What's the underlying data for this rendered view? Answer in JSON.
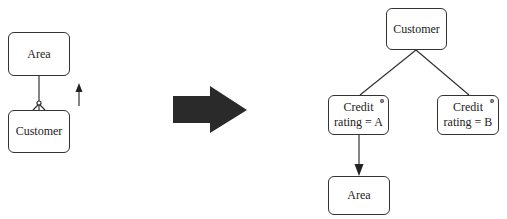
{
  "left": {
    "area_box": {
      "label": "Area"
    },
    "customer_box": {
      "label": "Customer"
    }
  },
  "right": {
    "customer_box": {
      "label": "Customer"
    },
    "credit_a_box": {
      "label": "Credit\nrating = A",
      "marker": "o"
    },
    "credit_b_box": {
      "label": "Credit\nrating = B",
      "marker": "o"
    },
    "area_box": {
      "label": "Area"
    }
  },
  "colors": {
    "stroke": "#333333",
    "arrow_fill": "#2a2a2a"
  }
}
